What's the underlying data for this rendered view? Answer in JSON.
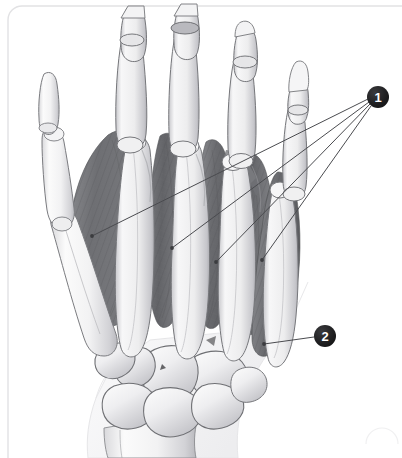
{
  "figure": {
    "background_color": "#ffffff",
    "panel": {
      "border_color": "#e2e2e4",
      "corner_radius": 14,
      "x": 8,
      "y": 6,
      "width": 394,
      "height": 452
    }
  },
  "palette": {
    "bone_light": "#fbfbfb",
    "bone_mid": "#ededee",
    "bone_shadow": "#c9c9cc",
    "bone_outline": "#6f7074",
    "muscle_dark": "#6c6d70",
    "muscle_mid": "#87888c",
    "muscle_light": "#a6a7ab",
    "muscle_fiber": "#5a5b5e",
    "leader_line": "#4a4b4f",
    "marker_fill": "#1d1d1f",
    "marker_text": "#ffffff",
    "soft_tissue": "#f6f6f7"
  },
  "callouts": [
    {
      "id": "callout-1",
      "label": "1",
      "marker": {
        "cx": 378,
        "cy": 97,
        "r": 11
      },
      "leader_targets": [
        {
          "x": 92,
          "y": 236
        },
        {
          "x": 172,
          "y": 248
        },
        {
          "x": 216,
          "y": 262
        },
        {
          "x": 262,
          "y": 260
        }
      ]
    },
    {
      "id": "callout-2",
      "label": "2",
      "marker": {
        "cx": 325,
        "cy": 336,
        "r": 11
      },
      "leader_targets": [
        {
          "x": 264,
          "y": 344
        }
      ]
    }
  ],
  "anatomy": {
    "regions": [
      {
        "name": "distal-phalanges",
        "type": "bone",
        "count": 5
      },
      {
        "name": "middle-phalanges",
        "type": "bone",
        "count": 4
      },
      {
        "name": "proximal-phalanges",
        "type": "bone",
        "count": 5
      },
      {
        "name": "metacarpals",
        "type": "bone",
        "count": 5
      },
      {
        "name": "carpal-bones",
        "type": "bone",
        "count": 8
      },
      {
        "name": "radius-ulna",
        "type": "bone",
        "count": 2
      },
      {
        "name": "dorsal-interossei",
        "type": "muscle",
        "count": 4
      },
      {
        "name": "abductor-digiti-minimi",
        "type": "muscle",
        "count": 1
      },
      {
        "name": "first-dorsal-interosseous",
        "type": "muscle",
        "count": 1
      }
    ]
  }
}
